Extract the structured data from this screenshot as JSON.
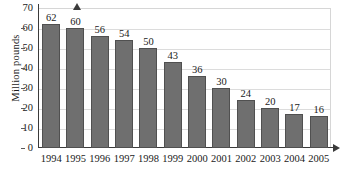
{
  "chart_data": {
    "type": "bar",
    "title": "",
    "subtitle": "",
    "xlabel": "",
    "ylabel": "Million pounds",
    "categories": [
      "1994",
      "1995",
      "1996",
      "1997",
      "1998",
      "1999",
      "2000",
      "2001",
      "2002",
      "2003",
      "2004",
      "2005"
    ],
    "values": [
      62,
      60,
      56,
      54,
      50,
      43,
      36,
      30,
      24,
      20,
      17,
      16
    ],
    "data_labels": [
      "62",
      "60",
      "56",
      "54",
      "50",
      "43",
      "36",
      "30",
      "24",
      "20",
      "17",
      "16"
    ],
    "ylim": [
      0,
      70
    ],
    "y_ticks": [
      0,
      10,
      20,
      30,
      40,
      50,
      60,
      70
    ],
    "y_tick_labels": [
      "0",
      "10",
      "20",
      "30",
      "40",
      "50",
      "60",
      "70"
    ],
    "grid": true,
    "grid_orientation": "horizontal",
    "legend": false,
    "legend_position": "none",
    "bar_color": "#6f6f6f",
    "bar_edge_color": "#505050",
    "grid_color": "#dcdcdc",
    "axis_color": "#3a3a3a",
    "plot_border_color": "#d6d6d6",
    "background_color": "#ffffff",
    "text_color": "#1a1a1a",
    "axis_arrows": true
  }
}
